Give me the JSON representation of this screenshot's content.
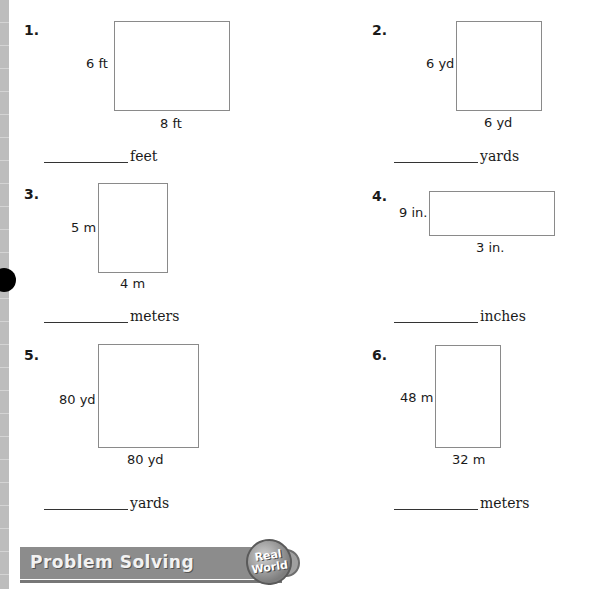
{
  "problems": [
    {
      "number": "1.",
      "side_label": "6 ft",
      "bottom_label": "8 ft",
      "unit": "feet",
      "answer": ""
    },
    {
      "number": "2.",
      "side_label": "6 yd",
      "bottom_label": "6 yd",
      "unit": "yards",
      "answer": ""
    },
    {
      "number": "3.",
      "side_label": "5 m",
      "bottom_label": "4 m",
      "unit": "meters",
      "answer": ""
    },
    {
      "number": "4.",
      "side_label": "9 in.",
      "bottom_label": "3 in.",
      "unit": "inches",
      "answer": ""
    },
    {
      "number": "5.",
      "side_label": "80 yd",
      "bottom_label": "80 yd",
      "unit": "yards",
      "answer": ""
    },
    {
      "number": "6.",
      "side_label": "48 m",
      "bottom_label": "32 m",
      "unit": "meters",
      "answer": ""
    }
  ],
  "banner": {
    "title": "Problem Solving",
    "badge_line1": "Real",
    "badge_line2": "World"
  }
}
